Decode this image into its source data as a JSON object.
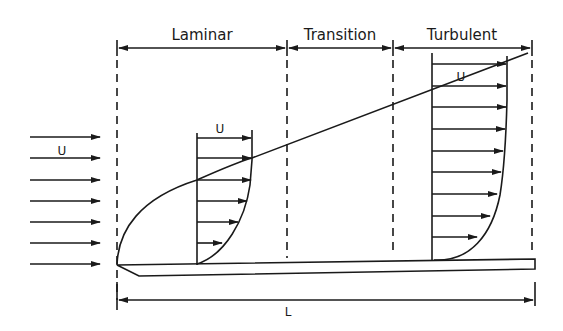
{
  "diagram": {
    "regions": [
      {
        "label": "Laminar"
      },
      {
        "label": "Transition"
      },
      {
        "label": "Turbulent"
      }
    ],
    "free_stream": {
      "label": "U",
      "arrow_count": 7
    },
    "laminar_profile": {
      "label": "U",
      "arrow_count": 6
    },
    "turbulent_profile": {
      "label": "U",
      "arrow_count": 10
    },
    "plate_length": {
      "label": "L"
    },
    "colors": {
      "ink": "#1a1a1a",
      "background": "#ffffff"
    }
  }
}
